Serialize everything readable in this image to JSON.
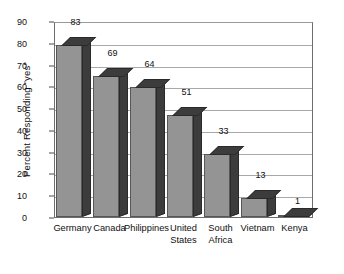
{
  "chart_data": {
    "type": "bar",
    "title": "",
    "xlabel": "",
    "ylabel": "Percent Responding \"yes\"",
    "ylim": [
      0,
      90
    ],
    "yticks": [
      0,
      10,
      20,
      30,
      40,
      50,
      60,
      70,
      80,
      90
    ],
    "grid": true,
    "legend": false,
    "categories": [
      "Germany",
      "Canada",
      "Philippines",
      "United States",
      "South Africa",
      "Vietnam",
      "Kenya"
    ],
    "category_lines": [
      [
        "Germany"
      ],
      [
        "Canada"
      ],
      [
        "Philippines"
      ],
      [
        "United",
        "States"
      ],
      [
        "South",
        "Africa"
      ],
      [
        "Vietnam"
      ],
      [
        "Kenya"
      ]
    ],
    "values": [
      83,
      69,
      64,
      51,
      33,
      13,
      1
    ],
    "value_labels": [
      "83",
      "69",
      "64",
      "51",
      "33",
      "13",
      "1"
    ],
    "style": {
      "bar_face_color": "#949494",
      "bar_shadow_color": "#3c3c3c",
      "bar_edge_color": "#575757",
      "grid_color": "#a8a8a8",
      "axis_color": "#6d6d6d",
      "text_color": "#111111",
      "background": "#ffffff",
      "three_d": true
    }
  }
}
